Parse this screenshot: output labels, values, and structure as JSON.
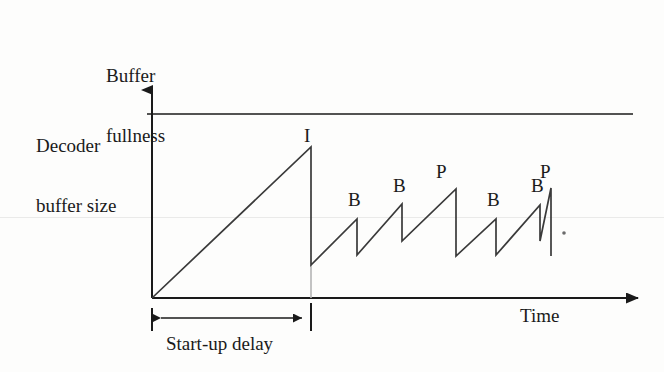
{
  "figure": {
    "kind": "line-diagram",
    "background_color": "#fdfdfc",
    "ink_color": "#1a1a1a",
    "guide_color": "#b4b4b4"
  },
  "axes": {
    "y_axis_title_line1": "Buffer",
    "y_axis_title_line2": "fullness",
    "x_axis_title": "Time",
    "y_axis": {
      "x": 152,
      "top": 78,
      "bottom": 298,
      "arrow": "up"
    },
    "x_axis": {
      "y": 298,
      "left": 152,
      "right": 650,
      "arrow": "right"
    }
  },
  "reference_line": {
    "label_line1": "Decoder",
    "label_line2": "buffer size",
    "y": 114,
    "x_start": 152,
    "x_end": 633
  },
  "annotation": {
    "startup_delay_label": "Start-up delay",
    "bracket": {
      "y": 318,
      "x_left": 152,
      "x_right": 311
    },
    "tick_left_x": 152,
    "tick_right_x": 311,
    "tick_top": 306,
    "tick_bottom": 331
  },
  "guide_line": {
    "x": 311,
    "y_top": 265,
    "y_bottom": 298
  },
  "trailing_dot": {
    "x": 564,
    "y": 233
  },
  "chart_data": {
    "type": "line",
    "title": "",
    "xlabel": "Time",
    "ylabel": "Buffer fullness",
    "frame_labels": [
      "I",
      "B",
      "B",
      "P",
      "B",
      "B",
      "P"
    ],
    "segments": [
      {
        "label": "I",
        "rise_from_x": 152,
        "rise_from_y": 298,
        "peak_x": 311,
        "peak_y": 147,
        "drop_to_y": 265,
        "label_x": 304,
        "label_y": 126
      },
      {
        "label": "B",
        "rise_from_x": 311,
        "rise_from_y": 265,
        "peak_x": 357,
        "peak_y": 219,
        "drop_to_y": 255,
        "label_x": 348,
        "label_y": 190
      },
      {
        "label": "B",
        "rise_from_x": 357,
        "rise_from_y": 255,
        "peak_x": 402,
        "peak_y": 204,
        "drop_to_y": 241,
        "label_x": 393,
        "label_y": 176
      },
      {
        "label": "P",
        "rise_from_x": 402,
        "rise_from_y": 241,
        "peak_x": 456,
        "peak_y": 189,
        "drop_to_y": 256,
        "label_x": 436,
        "label_y": 162
      },
      {
        "label": "B",
        "rise_from_x": 456,
        "rise_from_y": 256,
        "peak_x": 496,
        "peak_y": 219,
        "drop_to_y": 255,
        "label_x": 487,
        "label_y": 190
      },
      {
        "label": "B",
        "rise_from_x": 496,
        "rise_from_y": 255,
        "peak_x": 540,
        "peak_y": 205,
        "drop_to_y": 241,
        "label_x": 531,
        "label_y": 176
      },
      {
        "label": "P",
        "rise_from_x": 540,
        "rise_from_y": 241,
        "peak_x": 551,
        "peak_y": 188,
        "drop_to_y": 256,
        "label_x": 540,
        "label_y": 162
      }
    ],
    "ylim_note": "Buffer fullness shown qualitatively; upper bound is the decoder buffer size line.",
    "grid": false,
    "legend": "none"
  }
}
